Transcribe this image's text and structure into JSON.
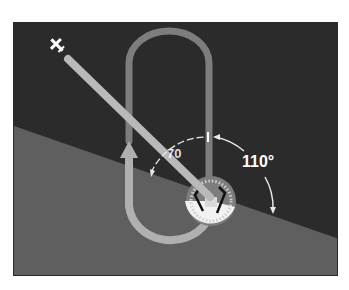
{
  "diagram": {
    "type": "holding-pattern-entry",
    "labels": {
      "angle_large": "110°",
      "angle_small": "70"
    },
    "colors": {
      "sky_sector": "#2b2b2b",
      "ground_sector": "#5f5f5f",
      "racetrack": "#8c8c8c",
      "inbound_track": "#b9b9b9",
      "arc_markers": "#e8e8e8",
      "fix_disc": "#f2f2f2"
    },
    "icons": [
      "airplane-icon",
      "arrow-icon",
      "navaid-fix-icon"
    ]
  }
}
